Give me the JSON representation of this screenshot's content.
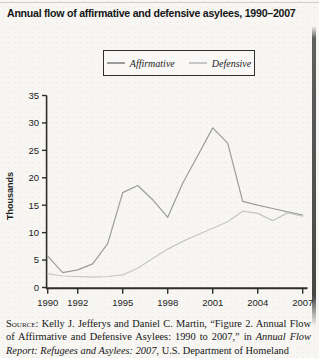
{
  "title": "Annual flow of affirmative and defensive asylees, 1990–2007",
  "legend": {
    "position": "top-center"
  },
  "chart_data": {
    "type": "line",
    "title": "Annual flow of affirmative and defensive asylees, 1990–2007",
    "xlabel": "",
    "ylabel": "Thousands",
    "ylim": [
      0,
      35
    ],
    "yticks": [
      0,
      5,
      10,
      15,
      20,
      25,
      30,
      35
    ],
    "xticks": [
      1990,
      1992,
      1995,
      1998,
      2001,
      2004,
      2007
    ],
    "grid": false,
    "legend_position": "top",
    "axis_color": "#2e2e2e",
    "x": [
      1990,
      1991,
      1992,
      1993,
      1994,
      1995,
      1996,
      1997,
      1998,
      1999,
      2000,
      2001,
      2002,
      2003,
      2004,
      2005,
      2006,
      2007
    ],
    "series": [
      {
        "name": "Affirmative",
        "color": "#9c9c9c",
        "values": [
          5.7,
          2.7,
          3.2,
          4.3,
          8.0,
          17.3,
          18.6,
          16.0,
          12.8,
          19.0,
          24.0,
          29.1,
          26.3,
          15.7,
          15.0,
          14.4,
          13.8,
          13.2
        ]
      },
      {
        "name": "Defensive",
        "color": "#c6c6c6",
        "values": [
          2.5,
          2.1,
          2.0,
          1.9,
          2.0,
          2.3,
          3.5,
          5.3,
          7.0,
          8.4,
          9.6,
          10.8,
          12.0,
          13.9,
          13.5,
          12.2,
          13.6,
          13.0
        ]
      }
    ]
  },
  "source": {
    "segments": [
      {
        "style": "smallcaps",
        "text": "Source: "
      },
      {
        "style": "normal",
        "text": "Kelly J. Jefferys and Daniel C. Martin, “Figure 2. Annual Flow of Affirmative and Defensive Asylees: 1990 to 2007,” in "
      },
      {
        "style": "italic",
        "text": "Annual Flow Report: Refugees and Asylees: 2007"
      },
      {
        "style": "normal",
        "text": ", U.S. Department of Homeland"
      }
    ]
  }
}
